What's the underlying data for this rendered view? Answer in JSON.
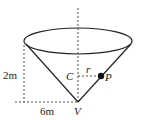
{
  "diagram": {
    "type": "cone",
    "labels": {
      "height": "2m",
      "radius": "6m",
      "center": "C",
      "point": "P",
      "vertex": "V",
      "r": "r"
    },
    "colors": {
      "stroke": "#222222",
      "background": "#ffffff"
    }
  }
}
